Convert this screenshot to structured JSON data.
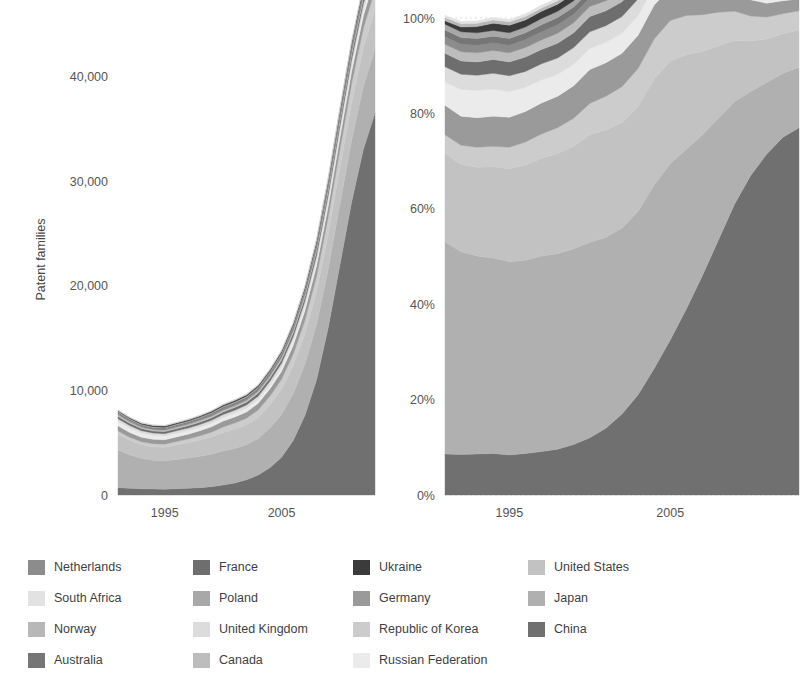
{
  "figure": {
    "background": "#ffffff",
    "text_color": "#4a4a4a"
  },
  "legend": {
    "name": "chart-legend",
    "columns": 4,
    "entries": [
      {
        "label": "Netherlands",
        "color": "#8c8c8c"
      },
      {
        "label": "France",
        "color": "#6e6e6e"
      },
      {
        "label": "Ukraine",
        "color": "#3b3b3b"
      },
      {
        "label": "United States",
        "color": "#c2c2c2"
      },
      {
        "label": "South Africa",
        "color": "#e2e2e2"
      },
      {
        "label": "Poland",
        "color": "#a8a8a8"
      },
      {
        "label": "Germany",
        "color": "#9a9a9a"
      },
      {
        "label": "Japan",
        "color": "#b0b0b0"
      },
      {
        "label": "Norway",
        "color": "#b8b8b8"
      },
      {
        "label": "United Kingdom",
        "color": "#dcdcdc"
      },
      {
        "label": "Republic of Korea",
        "color": "#cccccc"
      },
      {
        "label": "China",
        "color": "#707070"
      },
      {
        "label": "Australia",
        "color": "#767676"
      },
      {
        "label": "Canada",
        "color": "#bdbdbd"
      },
      {
        "label": "Russian Federation",
        "color": "#ebebeb"
      }
    ]
  },
  "chart_data": [
    {
      "id": "absolute-chart",
      "type": "area",
      "stacked": true,
      "title": "",
      "xlabel": "",
      "ylabel": "Patent families",
      "xlim": [
        1991,
        2013
      ],
      "ylim": [
        0,
        45000
      ],
      "grid": false,
      "legend_position": "bottom",
      "x": [
        1991,
        1992,
        1993,
        1994,
        1995,
        1996,
        1997,
        1998,
        1999,
        2000,
        2001,
        2002,
        2003,
        2004,
        2005,
        2006,
        2007,
        2008,
        2009,
        2010,
        2011,
        2012,
        2013
      ],
      "xticks": [
        1995,
        2005
      ],
      "xticklabels": [
        "1995",
        "2005"
      ],
      "yticks": [
        0,
        10000,
        20000,
        30000,
        40000
      ],
      "yticklabels": [
        "0",
        "10,000",
        "20,000",
        "30,000",
        "40,000"
      ],
      "series": [
        {
          "name": "China",
          "color": "#707070",
          "values": [
            700,
            640,
            600,
            580,
            560,
            600,
            640,
            700,
            800,
            950,
            1150,
            1450,
            1900,
            2600,
            3600,
            5200,
            7600,
            11000,
            16000,
            22000,
            28000,
            33000,
            36500
          ]
        },
        {
          "name": "Japan",
          "color": "#b0b0b0",
          "values": [
            3600,
            3200,
            2900,
            2750,
            2700,
            2800,
            2900,
            3000,
            3100,
            3250,
            3300,
            3350,
            3500,
            3800,
            4100,
            4500,
            4900,
            5300,
            5600,
            5800,
            5900,
            6000,
            6100
          ]
        },
        {
          "name": "United States",
          "color": "#c2c2c2",
          "values": [
            1500,
            1380,
            1300,
            1280,
            1300,
            1380,
            1450,
            1550,
            1650,
            1780,
            1850,
            1900,
            2000,
            2200,
            2400,
            2650,
            2900,
            3150,
            3350,
            3500,
            3600,
            3700,
            3750
          ]
        },
        {
          "name": "Republic of Korea",
          "color": "#cccccc",
          "values": [
            320,
            300,
            290,
            290,
            300,
            330,
            360,
            400,
            450,
            520,
            580,
            640,
            720,
            830,
            950,
            1100,
            1280,
            1450,
            1600,
            1720,
            1800,
            1870,
            1920
          ]
        },
        {
          "name": "Germany",
          "color": "#9a9a9a",
          "values": [
            500,
            460,
            430,
            420,
            420,
            440,
            460,
            490,
            520,
            560,
            580,
            600,
            640,
            700,
            760,
            840,
            920,
            1000,
            1060,
            1110,
            1150,
            1180,
            1200
          ]
        },
        {
          "name": "Russian Federation",
          "color": "#ebebeb",
          "values": [
            400,
            420,
            400,
            380,
            360,
            350,
            340,
            340,
            345,
            350,
            355,
            360,
            370,
            390,
            410,
            440,
            470,
            500,
            530,
            560,
            580,
            600,
            615
          ]
        },
        {
          "name": "United Kingdom",
          "color": "#dcdcdc",
          "values": [
            260,
            240,
            225,
            220,
            220,
            230,
            240,
            250,
            265,
            280,
            290,
            300,
            315,
            340,
            365,
            400,
            435,
            470,
            500,
            520,
            540,
            555,
            565
          ]
        },
        {
          "name": "France",
          "color": "#6e6e6e",
          "values": [
            230,
            210,
            198,
            195,
            198,
            205,
            215,
            225,
            238,
            250,
            258,
            266,
            280,
            300,
            322,
            352,
            382,
            412,
            436,
            456,
            472,
            484,
            492
          ]
        },
        {
          "name": "Canada",
          "color": "#bdbdbd",
          "values": [
            150,
            140,
            132,
            130,
            132,
            138,
            144,
            151,
            160,
            168,
            174,
            180,
            189,
            203,
            218,
            238,
            258,
            278,
            294,
            308,
            318,
            326,
            332
          ]
        },
        {
          "name": "Netherlands",
          "color": "#8c8c8c",
          "values": [
            130,
            120,
            113,
            111,
            113,
            118,
            124,
            130,
            137,
            144,
            149,
            154,
            162,
            174,
            187,
            204,
            222,
            240,
            254,
            265,
            274,
            281,
            286
          ]
        },
        {
          "name": "Australia",
          "color": "#767676",
          "values": [
            110,
            102,
            96,
            94,
            96,
            100,
            105,
            110,
            116,
            122,
            126,
            131,
            137,
            148,
            159,
            173,
            188,
            203,
            215,
            225,
            232,
            238,
            242
          ]
        },
        {
          "name": "Poland",
          "color": "#a8a8a8",
          "values": [
            95,
            88,
            83,
            81,
            83,
            86,
            90,
            95,
            100,
            105,
            109,
            113,
            119,
            128,
            137,
            149,
            162,
            175,
            185,
            194,
            200,
            205,
            209
          ]
        },
        {
          "name": "Ukraine",
          "color": "#3b3b3b",
          "values": [
            60,
            78,
            92,
            100,
            104,
            106,
            108,
            110,
            112,
            114,
            116,
            118,
            122,
            128,
            135,
            144,
            154,
            164,
            172,
            179,
            185,
            189,
            192
          ]
        },
        {
          "name": "Norway",
          "color": "#b8b8b8",
          "values": [
            55,
            51,
            48,
            47,
            48,
            50,
            52,
            55,
            58,
            61,
            63,
            65,
            68,
            74,
            79,
            86,
            94,
            101,
            107,
            112,
            116,
            119,
            121
          ]
        },
        {
          "name": "South Africa",
          "color": "#e2e2e2",
          "values": [
            45,
            42,
            39,
            38,
            39,
            41,
            43,
            45,
            47,
            50,
            51,
            53,
            56,
            60,
            65,
            70,
            77,
            83,
            88,
            92,
            95,
            97,
            99
          ]
        }
      ]
    },
    {
      "id": "share-chart",
      "type": "area",
      "stacked": true,
      "normalized": true,
      "title": "",
      "xlabel": "",
      "ylabel": "",
      "xlim": [
        1991,
        2013
      ],
      "ylim": [
        0,
        100
      ],
      "grid": true,
      "legend_position": "bottom",
      "x": [
        1991,
        1992,
        1993,
        1994,
        1995,
        1996,
        1997,
        1998,
        1999,
        2000,
        2001,
        2002,
        2003,
        2004,
        2005,
        2006,
        2007,
        2008,
        2009,
        2010,
        2011,
        2012,
        2013
      ],
      "xticks": [
        1995,
        2005
      ],
      "xticklabels": [
        "1995",
        "2005"
      ],
      "yticks": [
        0,
        20,
        40,
        60,
        80,
        100
      ],
      "yticklabels": [
        "0%",
        "20%",
        "40%",
        "60%",
        "80%",
        "100%"
      ],
      "series": [
        {
          "name": "China",
          "color": "#707070",
          "values": [
            8.6,
            8.5,
            8.6,
            8.7,
            8.4,
            8.7,
            9.1,
            9.6,
            10.6,
            12.0,
            14.0,
            17.0,
            21.0,
            26.5,
            32.5,
            39.0,
            46.0,
            53.5,
            61.0,
            67.0,
            71.5,
            75.0,
            77.0
          ]
        },
        {
          "name": "Japan",
          "color": "#b0b0b0",
          "values": [
            44.5,
            42.5,
            41.5,
            41.0,
            40.5,
            40.5,
            41.0,
            41.0,
            41.0,
            41.0,
            40.0,
            39.0,
            38.5,
            38.5,
            37.0,
            33.5,
            29.5,
            25.5,
            21.5,
            17.6,
            15.0,
            13.4,
            12.7
          ]
        },
        {
          "name": "United States",
          "color": "#c2c2c2",
          "values": [
            18.5,
            18.3,
            18.6,
            19.1,
            19.5,
            20.0,
            20.5,
            21.0,
            21.5,
            22.5,
            22.5,
            22.1,
            22.0,
            22.2,
            21.5,
            19.8,
            17.5,
            15.2,
            12.8,
            10.6,
            9.1,
            8.3,
            7.8
          ]
        },
        {
          "name": "Republic of Korea",
          "color": "#cccccc",
          "values": [
            3.9,
            4.0,
            4.2,
            4.3,
            4.5,
            4.8,
            5.1,
            5.4,
            5.9,
            6.6,
            7.1,
            7.5,
            7.9,
            8.4,
            8.5,
            8.2,
            7.7,
            7.0,
            6.1,
            5.2,
            4.6,
            4.2,
            4.0
          ]
        },
        {
          "name": "Germany",
          "color": "#9a9a9a",
          "values": [
            6.2,
            6.1,
            6.2,
            6.3,
            6.3,
            6.4,
            6.5,
            6.6,
            6.8,
            7.1,
            7.0,
            7.0,
            7.0,
            7.1,
            6.8,
            6.3,
            5.6,
            4.8,
            4.0,
            3.4,
            2.9,
            2.7,
            2.5
          ]
        },
        {
          "name": "Russian Federation",
          "color": "#ebebeb",
          "values": [
            4.9,
            5.6,
            5.7,
            5.7,
            5.4,
            5.1,
            4.8,
            4.6,
            4.5,
            4.4,
            4.3,
            4.2,
            4.1,
            4.0,
            3.7,
            3.3,
            2.8,
            2.4,
            2.0,
            1.7,
            1.5,
            1.4,
            1.3
          ]
        },
        {
          "name": "United Kingdom",
          "color": "#dcdcdc",
          "values": [
            3.2,
            3.2,
            3.2,
            3.3,
            3.3,
            3.3,
            3.4,
            3.4,
            3.5,
            3.5,
            3.5,
            3.5,
            3.5,
            3.4,
            3.3,
            3.0,
            2.6,
            2.3,
            1.9,
            1.6,
            1.4,
            1.3,
            1.2
          ]
        },
        {
          "name": "France",
          "color": "#6e6e6e",
          "values": [
            2.8,
            2.8,
            2.8,
            2.9,
            2.9,
            3.0,
            3.0,
            3.1,
            3.1,
            3.2,
            3.1,
            3.1,
            3.1,
            3.0,
            2.9,
            2.6,
            2.3,
            2.0,
            1.7,
            1.4,
            1.2,
            1.1,
            1.0
          ]
        },
        {
          "name": "Canada",
          "color": "#bdbdbd",
          "values": [
            1.9,
            1.9,
            1.9,
            1.9,
            1.9,
            2.0,
            2.0,
            2.1,
            2.1,
            2.1,
            2.1,
            2.1,
            2.1,
            2.0,
            2.0,
            1.8,
            1.6,
            1.4,
            1.1,
            0.9,
            0.8,
            0.7,
            0.7
          ]
        },
        {
          "name": "Netherlands",
          "color": "#8c8c8c",
          "values": [
            1.6,
            1.6,
            1.6,
            1.6,
            1.6,
            1.7,
            1.7,
            1.8,
            1.8,
            1.8,
            1.8,
            1.8,
            1.8,
            1.7,
            1.7,
            1.5,
            1.3,
            1.2,
            1.0,
            0.8,
            0.7,
            0.6,
            0.6
          ]
        },
        {
          "name": "Australia",
          "color": "#767676",
          "values": [
            1.4,
            1.4,
            1.4,
            1.4,
            1.4,
            1.4,
            1.5,
            1.5,
            1.5,
            1.5,
            1.5,
            1.5,
            1.5,
            1.5,
            1.4,
            1.3,
            1.1,
            1.0,
            0.8,
            0.7,
            0.6,
            0.5,
            0.5
          ]
        },
        {
          "name": "Poland",
          "color": "#a8a8a8",
          "values": [
            1.2,
            1.2,
            1.2,
            1.2,
            1.2,
            1.2,
            1.3,
            1.3,
            1.3,
            1.3,
            1.3,
            1.3,
            1.3,
            1.3,
            1.2,
            1.1,
            1.0,
            0.9,
            0.7,
            0.6,
            0.5,
            0.5,
            0.4
          ]
        },
        {
          "name": "Ukraine",
          "color": "#3b3b3b",
          "values": [
            0.7,
            1.0,
            1.3,
            1.5,
            1.6,
            1.5,
            1.5,
            1.5,
            1.5,
            1.4,
            1.4,
            1.4,
            1.3,
            1.3,
            1.2,
            1.1,
            1.0,
            0.8,
            0.7,
            0.6,
            0.5,
            0.4,
            0.4
          ]
        },
        {
          "name": "Norway",
          "color": "#b8b8b8",
          "values": [
            0.7,
            0.7,
            0.7,
            0.7,
            0.7,
            0.7,
            0.7,
            0.7,
            0.8,
            0.8,
            0.8,
            0.8,
            0.8,
            0.7,
            0.7,
            0.6,
            0.6,
            0.5,
            0.4,
            0.3,
            0.3,
            0.3,
            0.2
          ]
        },
        {
          "name": "South Africa",
          "color": "#e2e2e2",
          "values": [
            0.5,
            0.5,
            0.5,
            0.5,
            0.5,
            0.6,
            0.6,
            0.6,
            0.6,
            0.6,
            0.6,
            0.6,
            0.6,
            0.6,
            0.6,
            0.5,
            0.4,
            0.4,
            0.3,
            0.3,
            0.2,
            0.2,
            0.2
          ]
        }
      ]
    }
  ]
}
